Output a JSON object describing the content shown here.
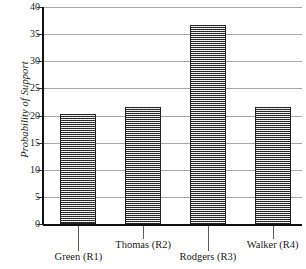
{
  "chart_data": {
    "type": "bar",
    "title": "",
    "xlabel": "",
    "ylabel": "Probability of Support",
    "categories": [
      "Green (R1)",
      "Thomas (R2)",
      "Rodgers (R3)",
      "Walker (R4)"
    ],
    "values": [
      20.3,
      21.5,
      36.7,
      21.5
    ],
    "ylim": [
      0,
      40
    ],
    "ytick_labels": [
      "40",
      "35",
      "30",
      "25",
      "20",
      "15",
      "10",
      "5",
      "0"
    ],
    "ytick_values": [
      40,
      35,
      30,
      25,
      20,
      15,
      10,
      5,
      0
    ],
    "grid": true,
    "legend": "none",
    "bar_fill": "#9c9c9c",
    "bar_border": "#232323",
    "gridline_color": "#a8a8a8",
    "axis_color": "#111111"
  },
  "axis": {
    "y_title": "Probability of Support"
  },
  "x_labels": [
    {
      "text": "Green (R1)",
      "row": "lower"
    },
    {
      "text": "Thomas (R2)",
      "row": "upper"
    },
    {
      "text": "Rodgers (R3)",
      "row": "lower"
    },
    {
      "text": "Walker (R4)",
      "row": "upper"
    }
  ]
}
